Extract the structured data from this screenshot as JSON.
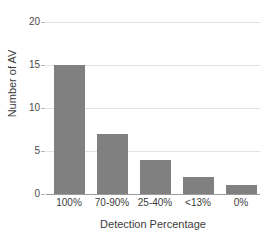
{
  "chart_data": {
    "type": "bar",
    "title": "",
    "subtitle": "",
    "categories": [
      "100%",
      "70-90%",
      "25-40%",
      "<13%",
      "0%"
    ],
    "values": [
      15,
      7,
      4,
      2,
      1
    ],
    "series": [
      {
        "name": "Number of AV",
        "values": [
          15,
          7,
          4,
          2,
          1
        ]
      }
    ],
    "xlabel": "Detection Percentage",
    "ylabel": "Number of AV",
    "ylim": [
      0,
      20
    ],
    "yticks": [
      0,
      5,
      10,
      15,
      20
    ],
    "ytick_labels": [
      "0",
      "5",
      "10",
      "15",
      "20"
    ],
    "grid": true,
    "grid_axis": "y",
    "legend": false,
    "legend_position": "none",
    "annotations": []
  },
  "style": {
    "bar_color": "#808080",
    "gridline_color": "#e2e2e2",
    "axis_color": "#9a9a9a",
    "tick_color": "#b4b4b4",
    "text_color": "#3c3c3c",
    "tick_label_color": "#4a4a4a",
    "background_color": "#ffffff"
  }
}
